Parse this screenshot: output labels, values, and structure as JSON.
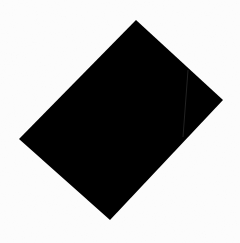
{
  "image": {
    "width": 240,
    "height": 243,
    "background_color": "#fcfcfc",
    "shape": {
      "type": "rotated-rectangle",
      "fill": "#000000",
      "points": [
        [
          136,
          20
        ],
        [
          223,
          100
        ],
        [
          110,
          220
        ],
        [
          19,
          139
        ]
      ]
    },
    "crease_line": {
      "color": "#2a2a2a",
      "from": [
        188,
        70
      ],
      "to": [
        183,
        137
      ]
    }
  }
}
